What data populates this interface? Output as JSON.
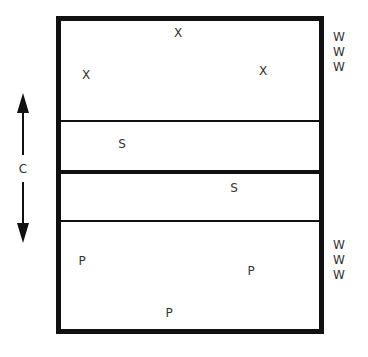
{
  "diagram": {
    "type": "volleyball court positioning",
    "arrow_label": "C",
    "top_side": {
      "players": [
        {
          "label": "X",
          "x": 178,
          "y": 33
        },
        {
          "label": "X",
          "x": 86,
          "y": 75
        },
        {
          "label": "X",
          "x": 263,
          "y": 71
        },
        {
          "label": "S",
          "x": 122,
          "y": 144
        }
      ],
      "waiting": [
        "W",
        "W",
        "W"
      ]
    },
    "bottom_side": {
      "players": [
        {
          "label": "S",
          "x": 234,
          "y": 188
        },
        {
          "label": "P",
          "x": 82,
          "y": 261
        },
        {
          "label": "P",
          "x": 251,
          "y": 271
        },
        {
          "label": "P",
          "x": 169,
          "y": 313
        }
      ],
      "waiting": [
        "W",
        "W",
        "W"
      ]
    }
  }
}
